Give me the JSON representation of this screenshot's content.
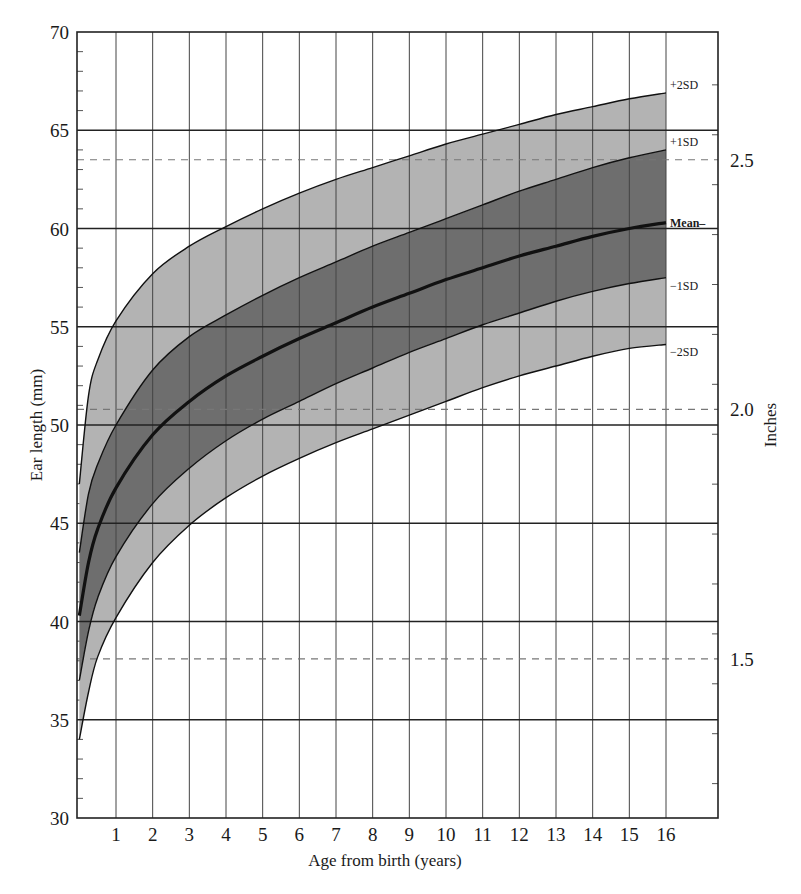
{
  "chart_data": {
    "type": "area",
    "title": "",
    "xlabel": "Age from birth (years)",
    "ylabel": "Ear length (mm)",
    "y2label": "Inches",
    "xlim": [
      0,
      17.4
    ],
    "ylim": [
      30,
      70
    ],
    "x_ticks": [
      1,
      2,
      3,
      4,
      5,
      6,
      7,
      8,
      9,
      10,
      11,
      12,
      13,
      14,
      15,
      16
    ],
    "y_ticks": [
      30,
      35,
      40,
      45,
      50,
      55,
      60,
      65,
      70
    ],
    "y2_ticks": [
      {
        "label": "1.5",
        "mm": 38.1
      },
      {
        "label": "2.0",
        "mm": 50.8
      },
      {
        "label": "2.5",
        "mm": 63.5
      }
    ],
    "grid": true,
    "x": [
      0,
      0.25,
      0.5,
      1,
      2,
      3,
      4,
      5,
      6,
      7,
      8,
      9,
      10,
      11,
      12,
      13,
      14,
      15,
      16
    ],
    "series": [
      {
        "name": "+2SD",
        "values": [
          47.0,
          51.5,
          53.3,
          55.3,
          57.7,
          59.1,
          60.1,
          61.0,
          61.8,
          62.5,
          63.1,
          63.7,
          64.3,
          64.8,
          65.3,
          65.8,
          66.2,
          66.6,
          66.9
        ]
      },
      {
        "name": "+1SD",
        "values": [
          43.5,
          46.5,
          48.0,
          50.0,
          52.8,
          54.5,
          55.6,
          56.6,
          57.5,
          58.3,
          59.1,
          59.8,
          60.5,
          61.2,
          61.9,
          62.5,
          63.1,
          63.6,
          64.0
        ]
      },
      {
        "name": "Mean",
        "values": [
          40.3,
          43.0,
          44.7,
          46.8,
          49.5,
          51.2,
          52.5,
          53.5,
          54.4,
          55.2,
          56.0,
          56.7,
          57.4,
          58.0,
          58.6,
          59.1,
          59.6,
          60.0,
          60.3
        ]
      },
      {
        "name": "-1SD",
        "values": [
          37.0,
          39.5,
          41.2,
          43.3,
          46.0,
          47.8,
          49.2,
          50.3,
          51.2,
          52.1,
          52.9,
          53.7,
          54.4,
          55.1,
          55.7,
          56.3,
          56.8,
          57.2,
          57.5
        ]
      },
      {
        "name": "-2SD",
        "values": [
          34.0,
          36.4,
          38.2,
          40.2,
          43.0,
          44.9,
          46.3,
          47.4,
          48.3,
          49.1,
          49.8,
          50.5,
          51.2,
          51.9,
          52.5,
          53.0,
          53.5,
          53.9,
          54.1
        ]
      }
    ],
    "series_labels": [
      "+2SD",
      "+1SD",
      "Mean",
      "−1SD",
      "−2SD"
    ],
    "bands": [
      {
        "from": "+1SD",
        "to": "+2SD",
        "color": "#b3b3b3"
      },
      {
        "from": "-1SD",
        "to": "+1SD",
        "color": "#6e6e6e"
      },
      {
        "from": "-2SD",
        "to": "-1SD",
        "color": "#b3b3b3"
      }
    ],
    "inch_reference_lines_dashed": [
      1.5,
      2.0,
      2.5
    ]
  },
  "labels": {
    "xlabel": "Age from birth (years)",
    "ylabel": "Ear length (mm)",
    "y2label": "Inches"
  }
}
